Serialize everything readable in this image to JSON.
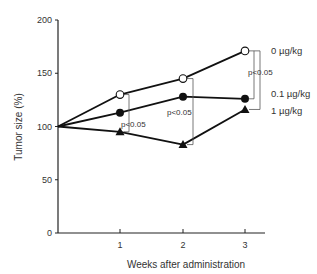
{
  "chart_data": {
    "type": "line",
    "title": "",
    "xlabel": "Weeks after administration",
    "ylabel": "Tumor size  (%)",
    "x": [
      0,
      1,
      2,
      3
    ],
    "x_tick_labels": [
      "1",
      "2",
      "3"
    ],
    "x_ticks": [
      1,
      2,
      3
    ],
    "y_ticks": [
      0,
      50,
      100,
      150,
      200
    ],
    "y_tick_labels": [
      "0",
      "50",
      "100",
      "150",
      "200"
    ],
    "ylim": [
      0,
      200
    ],
    "xlim": [
      0,
      3.3
    ],
    "grid": false,
    "series": [
      {
        "name": "0 µg/kg",
        "marker": "open-circle",
        "values": [
          100,
          130,
          145,
          171
        ]
      },
      {
        "name": "0.1 µg/kg",
        "marker": "filled-circle",
        "values": [
          100,
          113,
          128,
          126
        ]
      },
      {
        "name": "1 µg/kg",
        "marker": "filled-triangle",
        "values": [
          100,
          95,
          83,
          116
        ]
      }
    ],
    "annotations": [
      {
        "text": "p<0.05",
        "week": 1,
        "bracket": "0 µg/kg vs 1 µg/kg"
      },
      {
        "text": "p<0.05",
        "week": 2,
        "bracket": "0 µg/kg vs 1 µg/kg"
      },
      {
        "text": "p<0.05",
        "week": 3,
        "bracket": "0 µg/kg vs 0.1 µg/kg / 1 µg/kg"
      }
    ],
    "legend_position": "right (inline labels)"
  }
}
